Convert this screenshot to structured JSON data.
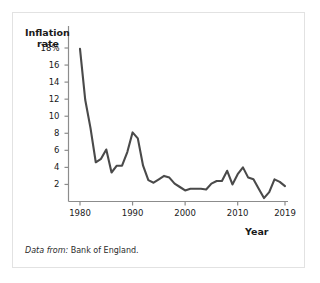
{
  "figure": {
    "source_note_lead": "Data from:",
    "source_note_text": "Bank of England."
  },
  "chart_data": {
    "type": "line",
    "title": "",
    "xlabel": "Year",
    "ylabel_line1": "Inflation",
    "ylabel_line2": "rate",
    "xlim": [
      1980,
      2019
    ],
    "ylim": [
      0,
      18
    ],
    "grid": false,
    "legend": "none",
    "line_color": "#4a4a4a",
    "axis_color": "#8c8c8c",
    "xticks": [
      1980,
      1990,
      2000,
      2010,
      2019
    ],
    "xtick_labels": [
      "1980",
      "1990",
      "2000",
      "2010",
      "2019"
    ],
    "yticks": [
      2,
      4,
      6,
      8,
      10,
      12,
      14,
      16,
      18
    ],
    "ytick_labels": [
      "2",
      "4",
      "6",
      "8",
      "10",
      "12",
      "14",
      "16",
      "18%"
    ],
    "series": [
      {
        "name": "Inflation rate",
        "x": [
          1980,
          1981,
          1982,
          1983,
          1984,
          1985,
          1986,
          1987,
          1988,
          1989,
          1990,
          1991,
          1992,
          1993,
          1994,
          1995,
          1996,
          1997,
          1998,
          1999,
          2000,
          2001,
          2002,
          2003,
          2004,
          2005,
          2006,
          2007,
          2008,
          2009,
          2010,
          2011,
          2012,
          2013,
          2014,
          2015,
          2016,
          2017,
          2018,
          2019
        ],
        "values": [
          17.9,
          11.9,
          8.6,
          4.6,
          5.0,
          6.1,
          3.4,
          4.2,
          4.2,
          5.8,
          8.1,
          7.4,
          4.2,
          2.5,
          2.2,
          2.6,
          3.0,
          2.8,
          2.1,
          1.7,
          1.3,
          1.5,
          1.5,
          1.5,
          1.4,
          2.1,
          2.4,
          2.4,
          3.6,
          2.0,
          3.2,
          4.0,
          2.8,
          2.6,
          1.5,
          0.4,
          1.1,
          2.6,
          2.3,
          1.8
        ]
      }
    ]
  }
}
